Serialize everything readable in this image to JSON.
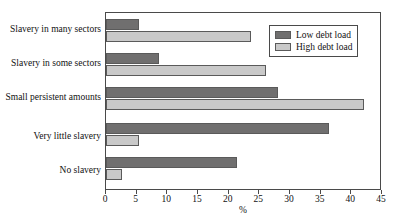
{
  "chart_data": {
    "type": "bar",
    "orientation": "horizontal",
    "title": "",
    "xlabel": "%",
    "ylabel": "",
    "xlim": [
      0,
      45
    ],
    "xticks": [
      0,
      5,
      10,
      15,
      20,
      25,
      30,
      35,
      40,
      45
    ],
    "grid": false,
    "legend_position": "top-right",
    "categories": [
      "Slavery in many sectors",
      "Slavery in some sectors",
      "Small persistent amounts",
      "Very little slavery",
      "No slavery"
    ],
    "series": [
      {
        "name": "Low debt load",
        "color": "#706f6f",
        "values": [
          5.4,
          8.6,
          28.0,
          36.4,
          21.4
        ]
      },
      {
        "name": "High debt load",
        "color": "#c9c9c9",
        "values": [
          23.7,
          26.1,
          42.1,
          5.3,
          2.6
        ]
      }
    ]
  },
  "legend": {
    "items": [
      {
        "label": "Low debt load"
      },
      {
        "label": "High debt load"
      }
    ]
  },
  "axis": {
    "x_title": "%"
  }
}
